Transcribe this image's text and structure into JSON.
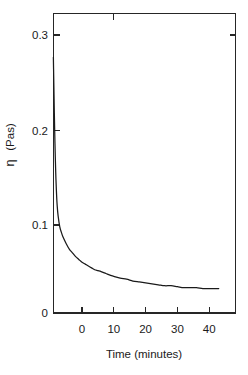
{
  "chart_data": {
    "type": "line",
    "title": "",
    "subtitle": "",
    "xlabel": "Time (minutes)",
    "ylabel_symbol": "η",
    "ylabel_units": "(Pas)",
    "ylabel": "η (Pas)",
    "xlim": [
      -9.5,
      45.5
    ],
    "ylim": [
      0,
      0.32
    ],
    "grid": false,
    "legend": "none",
    "xticks": [
      0,
      10,
      20,
      30,
      40
    ],
    "xtick_labels": [
      "0",
      "10",
      "20",
      "30",
      "40"
    ],
    "yticks": [
      0,
      0.1,
      0.2,
      0.3
    ],
    "ytick_labels": [
      "0",
      "0.1",
      "0.2",
      "0.3"
    ],
    "series": [
      {
        "name": "viscosity",
        "x": [
          -9.0,
          -8.9,
          -8.8,
          -8.7,
          -8.6,
          -8.5,
          -8.4,
          -8.3,
          -8.2,
          -8.0,
          -7.8,
          -7.5,
          -7.0,
          -6.5,
          -6.0,
          -5.0,
          -4.0,
          -3.0,
          -2.0,
          -1.0,
          0.0,
          1.0,
          2.0,
          3.0,
          4.0,
          5.0,
          6.0,
          7.5,
          9.0,
          10.0,
          12.0,
          14.0,
          16.0,
          18.0,
          20.0,
          22.0,
          24.0,
          26.0,
          28.0,
          30.0,
          32.0,
          34.0,
          36.0,
          38.0,
          40.0,
          42.0,
          43.0
        ],
        "y": [
          0.272,
          0.252,
          0.232,
          0.213,
          0.196,
          0.18,
          0.166,
          0.154,
          0.143,
          0.126,
          0.114,
          0.103,
          0.092,
          0.086,
          0.081,
          0.074,
          0.068,
          0.064,
          0.06,
          0.057,
          0.054,
          0.052,
          0.05,
          0.048,
          0.046,
          0.045,
          0.044,
          0.042,
          0.04,
          0.039,
          0.037,
          0.036,
          0.034,
          0.033,
          0.032,
          0.031,
          0.03,
          0.029,
          0.029,
          0.028,
          0.027,
          0.027,
          0.027,
          0.026,
          0.026,
          0.026,
          0.026
        ]
      }
    ],
    "curve_color": "#1a1a1a",
    "axis_color": "#262626",
    "background_color": "#ffffff"
  },
  "figure": {
    "xlabel": "Time (minutes)",
    "ylabel_symbol": "η",
    "ylabel_units": "(Pas)"
  }
}
